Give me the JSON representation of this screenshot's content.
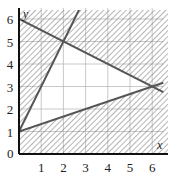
{
  "chart_data": {
    "type": "line",
    "title": "",
    "xlabel": "x",
    "ylabel": "y",
    "xlim": [
      0,
      6.5
    ],
    "ylim": [
      0,
      6.5
    ],
    "grid": true,
    "x_ticks": [
      "1",
      "2",
      "3",
      "4",
      "5",
      "6"
    ],
    "y_ticks": [
      "1",
      "2",
      "3",
      "4",
      "5",
      "6"
    ],
    "origin_label": "0",
    "series": [
      {
        "name": "y = 1 + 2x",
        "x": [
          0,
          2.75
        ],
        "y": [
          1,
          6.5
        ]
      },
      {
        "name": "y = 6 - x/2",
        "x": [
          0,
          6.5
        ],
        "y": [
          6,
          2.75
        ]
      },
      {
        "name": "y = 1 + x/3",
        "x": [
          0,
          6.5
        ],
        "y": [
          1,
          3.1667
        ]
      }
    ],
    "unshaded_region": {
      "description": "feasible region (unshaded) bounded by y >= 1 + x/3, y <= 6 - x/2, y <= 1 + 2x",
      "vertices": [
        [
          0,
          1
        ],
        [
          2,
          5
        ],
        [
          6,
          3
        ]
      ]
    },
    "shading": "hatched (diagonal lines) outside feasible region"
  }
}
